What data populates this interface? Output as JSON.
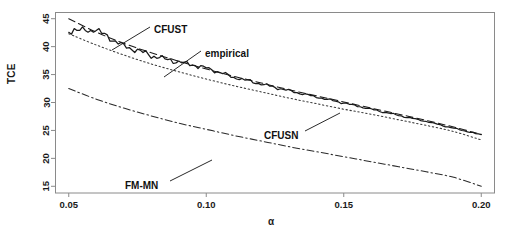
{
  "chart_data": {
    "type": "line",
    "title": "",
    "xlabel": "α",
    "ylabel": "TCE",
    "xlim": [
      0.045,
      0.205
    ],
    "ylim": [
      13.8,
      46.2
    ],
    "xticks": [
      0.05,
      0.1,
      0.15,
      0.2
    ],
    "xticklabels": [
      "0.05",
      "0.10",
      "0.15",
      "0.20"
    ],
    "yticks": [
      15,
      20,
      25,
      30,
      35,
      40,
      45
    ],
    "yticklabels": [
      "15",
      "20",
      "25",
      "30",
      "35",
      "40",
      "45"
    ],
    "grid": false,
    "legend": "none (inline annotations with leader lines)",
    "x": [
      0.05,
      0.06,
      0.07,
      0.08,
      0.09,
      0.1,
      0.11,
      0.12,
      0.13,
      0.14,
      0.15,
      0.16,
      0.17,
      0.18,
      0.19,
      0.2
    ],
    "series": [
      {
        "name": "CFUST",
        "style": "dashed",
        "color": "#1a1a1a",
        "values": [
          45.0,
          42.6,
          40.6,
          38.9,
          37.4,
          36.0,
          34.7,
          33.5,
          32.3,
          31.2,
          30.1,
          29.0,
          27.9,
          26.8,
          25.6,
          24.3
        ]
      },
      {
        "name": "empirical",
        "style": "solid-stepped",
        "color": "#1a1a1a",
        "values": [
          42.9,
          42.9,
          40.2,
          38.4,
          37.2,
          36.2,
          34.5,
          33.3,
          32.1,
          31.0,
          29.9,
          28.8,
          27.7,
          26.6,
          25.4,
          24.2
        ]
      },
      {
        "name": "CFUSN",
        "style": "dotted",
        "color": "#3a3a3a",
        "values": [
          42.3,
          40.3,
          38.5,
          36.9,
          35.5,
          34.2,
          33.0,
          31.9,
          30.8,
          29.8,
          28.8,
          27.9,
          26.9,
          25.9,
          24.8,
          23.3
        ]
      },
      {
        "name": "FM-MN",
        "style": "dash-dot",
        "color": "#2a2a2a",
        "values": [
          32.5,
          30.6,
          29.0,
          27.6,
          26.3,
          25.2,
          24.1,
          23.1,
          22.1,
          21.2,
          20.3,
          19.4,
          18.5,
          17.6,
          16.6,
          15.0
        ]
      }
    ],
    "annotations": [
      {
        "label": "CFUST",
        "text_x": 154,
        "text_y": 30,
        "leader_from_x": 150,
        "leader_from_y": 27,
        "leader_to_x": 112,
        "leader_to_y": 50
      },
      {
        "label": "empirical",
        "text_x": 205,
        "text_y": 54,
        "leader_from_x": 201,
        "leader_from_y": 51,
        "leader_to_x": 164,
        "leader_to_y": 77
      },
      {
        "label": "CFUSN",
        "text_x": 264,
        "text_y": 136,
        "leader_from_x": 305,
        "leader_from_y": 131,
        "leader_to_x": 340,
        "leader_to_y": 113
      },
      {
        "label": "FM-MN",
        "text_x": 125,
        "text_y": 186,
        "leader_from_x": 170,
        "leader_from_y": 181,
        "leader_to_x": 212,
        "leader_to_y": 160
      }
    ],
    "frame": {
      "left": 55,
      "right": 495,
      "top": 12,
      "bottom": 193,
      "border_color": "#8a8a8a"
    }
  }
}
